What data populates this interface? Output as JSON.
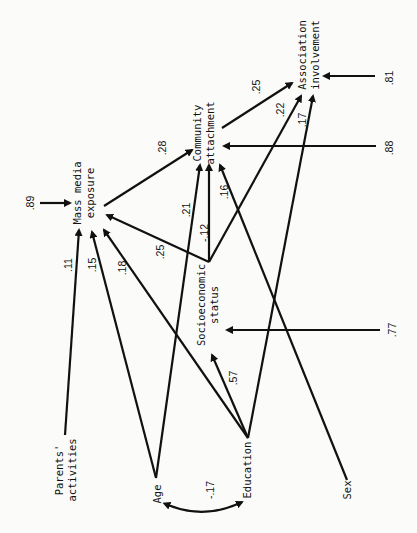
{
  "diagram": {
    "type": "path-diagram",
    "orientation": "rotated 90deg clockwise",
    "nodes": {
      "mme": {
        "line1": "Mass media",
        "line2": "exposure"
      },
      "ca": {
        "line1": "Community",
        "line2": "attachment"
      },
      "ai": {
        "line1": "Association",
        "line2": "involvement"
      },
      "ses": {
        "line1": "Socioeconomic",
        "line2": "status"
      },
      "pa": {
        "line1": "Parents'",
        "line2": "activities"
      },
      "age": {
        "line1": "Age"
      },
      "edu": {
        "line1": "Education"
      },
      "sex": {
        "line1": "Sex"
      }
    },
    "coefficients": {
      "pa_mme": ".11",
      "age_mme": ".15",
      "edu_mme": ".18",
      "age_ca": ".21",
      "ses_mme": ".25",
      "mme_ca": ".28",
      "ses_ca": "-.12",
      "sex_ca": ".16",
      "ses_ai": ".22",
      "edu_ai": ".17",
      "ca_ai": ".25",
      "edu_ses": ".57",
      "age_edu": "-.17",
      "res_mme": ".89",
      "res_ca": ".88",
      "res_ai": ".81",
      "res_ses": ".77"
    }
  }
}
